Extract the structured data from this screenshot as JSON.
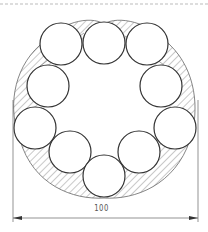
{
  "drawing": {
    "type": "technical-section-drawing",
    "description": "Ring of ten circles packed inside a hatched lobed boundary with width dimension",
    "dimension": {
      "label": "100",
      "direction": "horizontal",
      "x_start": 13,
      "x_end": 198,
      "y": 218
    },
    "circles": [
      {
        "cx": 104,
        "cy": 43,
        "r": 21
      },
      {
        "cx": 61,
        "cy": 44,
        "r": 21
      },
      {
        "cx": 147,
        "cy": 44,
        "r": 21
      },
      {
        "cx": 48,
        "cy": 86,
        "r": 21
      },
      {
        "cx": 161,
        "cy": 86,
        "r": 21
      },
      {
        "cx": 35,
        "cy": 128,
        "r": 21
      },
      {
        "cx": 175,
        "cy": 128,
        "r": 21
      },
      {
        "cx": 70,
        "cy": 152,
        "r": 21
      },
      {
        "cx": 139,
        "cy": 152,
        "r": 21
      },
      {
        "cx": 104,
        "cy": 176,
        "r": 21
      }
    ],
    "colors": {
      "stroke": "#333333",
      "hatch": "#777777",
      "construction": "#888888",
      "border_dash": "#aaaaaa"
    }
  }
}
